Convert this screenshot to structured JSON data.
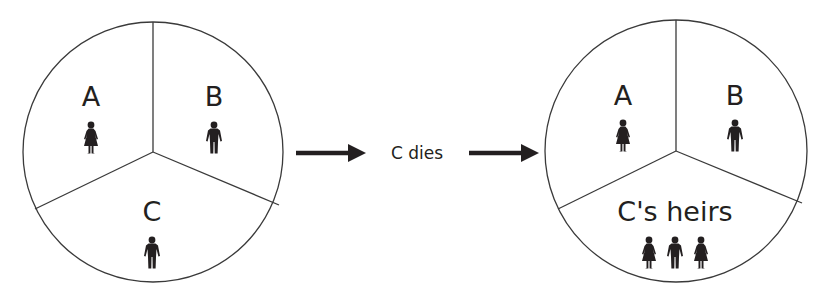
{
  "before": {
    "labels": {
      "a": "A",
      "b": "B",
      "c": "C"
    },
    "figures": {
      "a": "woman",
      "b": "man",
      "c": "man"
    }
  },
  "event": {
    "label": "C dies"
  },
  "after": {
    "labels": {
      "a": "A",
      "b": "B",
      "c": "C's heirs"
    },
    "figures": {
      "a": "woman",
      "b": "man",
      "c": [
        "woman",
        "man",
        "woman"
      ]
    }
  },
  "colors": {
    "ink": "#231f20",
    "line": "#3a3a3a",
    "background": "#ffffff"
  }
}
